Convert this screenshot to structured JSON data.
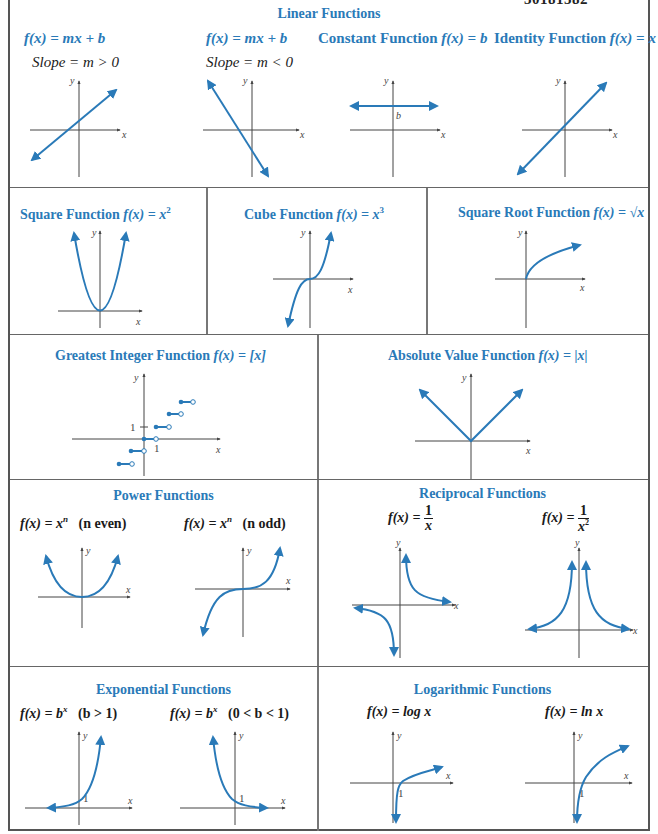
{
  "page_number": "30181582",
  "colors": {
    "accent_blue": "#2a7ab8",
    "axis": "#444444",
    "border": "#555555"
  },
  "sections": {
    "linear": {
      "title": "Linear Functions",
      "panels": [
        {
          "formula": "f(x) = mx + b",
          "subtitle": "Slope = m > 0",
          "graph": "line-positive-slope",
          "axis_x": "x",
          "axis_y": "y"
        },
        {
          "formula": "f(x) = mx + b",
          "subtitle": "Slope = m < 0",
          "graph": "line-negative-slope",
          "axis_x": "x",
          "axis_y": "y"
        },
        {
          "title": "Constant Function",
          "formula": "f(x) = b",
          "graph": "horizontal-line",
          "axis_x": "x",
          "axis_y": "y",
          "point_label": "b"
        },
        {
          "title": "Identity Function",
          "formula": "f(x) = x",
          "graph": "line-through-origin",
          "axis_x": "x",
          "axis_y": "y"
        }
      ]
    },
    "row2": {
      "panels": [
        {
          "title": "Square Function",
          "formula": "f(x) = x",
          "exp": "2",
          "graph": "parabola",
          "axis_x": "x",
          "axis_y": "y"
        },
        {
          "title": "Cube Function",
          "formula": "f(x) = x",
          "exp": "3",
          "graph": "cubic",
          "axis_x": "x",
          "axis_y": "y"
        },
        {
          "title": "Square Root Function",
          "formula": "f(x) = √x",
          "graph": "square-root",
          "axis_x": "x",
          "axis_y": "y"
        }
      ]
    },
    "row3": {
      "panels": [
        {
          "title": "Greatest Integer Function",
          "formula": "f(x) = [x]",
          "graph": "step",
          "axis_x": "x",
          "axis_y": "y",
          "tick_x": "1",
          "tick_y": "1"
        },
        {
          "title": "Absolute Value Function",
          "formula": "f(x) = |x|",
          "graph": "absolute-value",
          "axis_x": "x",
          "axis_y": "y"
        }
      ]
    },
    "power": {
      "title": "Power Functions",
      "panels": [
        {
          "formula": "f(x) = x",
          "exp": "n",
          "condition": "(n even)",
          "axis_x": "x",
          "axis_y": "y"
        },
        {
          "formula": "f(x) = x",
          "exp": "n",
          "condition": "(n odd)",
          "axis_x": "x",
          "axis_y": "y"
        }
      ]
    },
    "reciprocal": {
      "title": "Reciprocal Functions",
      "panels": [
        {
          "lhs": "f(x) =",
          "num": "1",
          "den": "x",
          "den_exp": "",
          "axis_x": "x",
          "axis_y": "y"
        },
        {
          "lhs": "f(x) =",
          "num": "1",
          "den": "x",
          "den_exp": "2",
          "axis_x": "x",
          "axis_y": "y"
        }
      ]
    },
    "exponential": {
      "title": "Exponential Functions",
      "panels": [
        {
          "formula": "f(x) = b",
          "exp": "x",
          "condition": "(b > 1)",
          "axis_x": "x",
          "axis_y": "y",
          "tick_label": "1"
        },
        {
          "formula": "f(x) = b",
          "exp": "x",
          "condition": "(0 < b < 1)",
          "axis_x": "x",
          "axis_y": "y",
          "tick_label": "1"
        }
      ]
    },
    "logarithmic": {
      "title": "Logarithmic Functions",
      "panels": [
        {
          "formula": "f(x) = log x",
          "axis_x": "x",
          "axis_y": "y",
          "tick_label": "1"
        },
        {
          "formula": "f(x) = ln x",
          "axis_x": "x",
          "axis_y": "y",
          "tick_label": "1"
        }
      ]
    }
  }
}
